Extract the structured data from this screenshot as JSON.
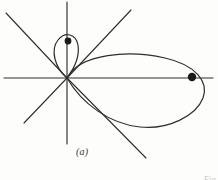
{
  "figure": {
    "caption": "(a)",
    "corner_note": "Fig",
    "stroke_color": "#2e2e2e",
    "dot_color": "#1a1a1a",
    "background_color": "#fdfdfc",
    "width": 218,
    "height": 180
  },
  "chart_data": {
    "type": "line",
    "title": "(a)",
    "xlabel": "",
    "ylabel": "",
    "grid": false,
    "legend": null,
    "origin": {
      "x": 67,
      "y": 78
    },
    "axes": [
      {
        "name": "horizontal-axis",
        "x1": 4,
        "y1": 78,
        "x2": 213,
        "y2": 78
      },
      {
        "name": "vertical-axis",
        "x1": 67,
        "y1": 2,
        "x2": 67,
        "y2": 144
      }
    ],
    "radial_lines": [
      {
        "name": "upper-left-ray",
        "x1": 67,
        "y1": 78,
        "x2": 6,
        "y2": 13
      },
      {
        "name": "upper-right-ray",
        "x1": 67,
        "y1": 78,
        "x2": 131,
        "y2": 10
      },
      {
        "name": "lower-left-ray",
        "x1": 67,
        "y1": 78,
        "x2": 24,
        "y2": 123
      },
      {
        "name": "lower-right-ray",
        "x1": 67,
        "y1": 78,
        "x2": 146,
        "y2": 158
      }
    ],
    "curves": [
      {
        "name": "large-petal",
        "description": "large right-hand petal of polar curve through origin",
        "path": "M 67 78 C 80 53, 130 50, 165 58 C 196 65, 209 82, 203 98 C 196 116, 168 130, 140 127 C 110 124, 82 104, 67 78 Z"
      },
      {
        "name": "small-loop",
        "description": "small upper loop of polar curve through origin",
        "path": "M 67 78 C 55 68, 50 50, 58 40 C 65 31, 76 34, 78 45 C 80 58, 73 70, 67 78 Z"
      }
    ],
    "points": [
      {
        "name": "outer-maximum-point",
        "x": 192,
        "y": 77,
        "r": 4.2
      },
      {
        "name": "inner-maximum-point",
        "x": 68,
        "y": 41,
        "r": 3.4
      }
    ],
    "xlim": [
      0,
      218
    ],
    "ylim": [
      180,
      0
    ]
  }
}
